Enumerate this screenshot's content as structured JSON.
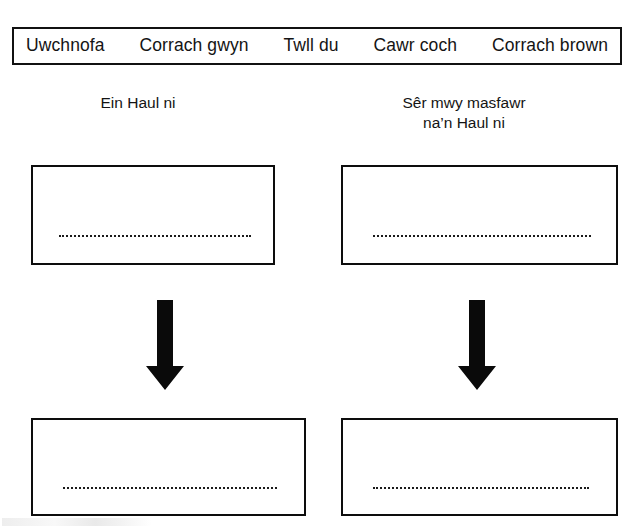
{
  "word_bank": {
    "items": [
      {
        "label": "Uwchnofa"
      },
      {
        "label": "Corrach gwyn"
      },
      {
        "label": "Twll du"
      },
      {
        "label": "Cawr coch"
      },
      {
        "label": "Corrach brown"
      }
    ]
  },
  "columns": [
    {
      "heading": "Ein Haul ni"
    },
    {
      "heading": "Sêr mwy masfawr\nna’n Haul ni"
    }
  ],
  "answer_boxes": {
    "top_left": {
      "value": ""
    },
    "top_right": {
      "value": ""
    },
    "bottom_left": {
      "value": ""
    },
    "bottom_right": {
      "value": ""
    }
  },
  "arrows": [
    {
      "name": "down-arrow-left",
      "direction": "down"
    },
    {
      "name": "down-arrow-right",
      "direction": "down"
    }
  ],
  "colors": {
    "ink": "#141414",
    "border": "#0d0d0d",
    "background": "#ffffff"
  }
}
